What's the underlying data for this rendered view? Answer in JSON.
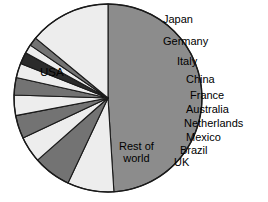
{
  "chart_data": {
    "type": "pie",
    "title": "",
    "subtitle": "",
    "xlabel": "",
    "ylabel": "",
    "legend_position": "callout-labels-right",
    "grid": false,
    "center": {
      "x": 108,
      "y": 98
    },
    "radius": 94,
    "start_angle_deg": 270,
    "direction": "clockwise",
    "categories": [
      "USA",
      "Japan",
      "Germany",
      "Italy",
      "China",
      "France",
      "Australia",
      "Netherlands",
      "Mexico",
      "Brazil",
      "UK",
      "Rest of world"
    ],
    "values": [
      49.0,
      8.0,
      6.5,
      4.5,
      4.0,
      3.5,
      3.0,
      2.5,
      2.0,
      1.5,
      1.5,
      14.0
    ],
    "slices": [
      {
        "label": "USA",
        "value": 49.0,
        "start_deg": 270.0,
        "end_deg": 86.4,
        "fill": "#8c8c8c",
        "label_placement": "inside",
        "label_x": 40,
        "label_y": 66
      },
      {
        "label": "Japan",
        "value": 8.0,
        "start_deg": 86.4,
        "end_deg": 115.2,
        "fill": "#ededed",
        "label_placement": "callout",
        "label_x": 163,
        "label_y": 14
      },
      {
        "label": "Germany",
        "value": 6.5,
        "start_deg": 115.2,
        "end_deg": 138.6,
        "fill": "#737373",
        "label_placement": "callout",
        "label_x": 163,
        "label_y": 36
      },
      {
        "label": "Italy",
        "value": 4.5,
        "start_deg": 138.6,
        "end_deg": 154.8,
        "fill": "#ededed",
        "label_placement": "callout",
        "label_x": 177,
        "label_y": 56
      },
      {
        "label": "China",
        "value": 4.0,
        "start_deg": 154.8,
        "end_deg": 169.2,
        "fill": "#737373",
        "label_placement": "callout",
        "label_x": 186,
        "label_y": 74
      },
      {
        "label": "France",
        "value": 3.5,
        "start_deg": 169.2,
        "end_deg": 181.8,
        "fill": "#ededed",
        "label_placement": "callout",
        "label_x": 190,
        "label_y": 90
      },
      {
        "label": "Australia",
        "value": 3.0,
        "start_deg": 181.8,
        "end_deg": 192.6,
        "fill": "#737373",
        "label_placement": "callout",
        "label_x": 186,
        "label_y": 104
      },
      {
        "label": "Netherlands",
        "value": 2.5,
        "start_deg": 192.6,
        "end_deg": 201.6,
        "fill": "#ededed",
        "label_placement": "callout",
        "label_x": 184,
        "label_y": 118
      },
      {
        "label": "Mexico",
        "value": 2.0,
        "start_deg": 201.6,
        "end_deg": 208.8,
        "fill": "#2b2b2b",
        "label_placement": "callout",
        "label_x": 186,
        "label_y": 132
      },
      {
        "label": "Brazil",
        "value": 1.5,
        "start_deg": 208.8,
        "end_deg": 214.2,
        "fill": "#ededed",
        "label_placement": "callout",
        "label_x": 180,
        "label_y": 145
      },
      {
        "label": "UK",
        "value": 1.5,
        "start_deg": 214.2,
        "end_deg": 219.6,
        "fill": "#737373",
        "label_placement": "callout",
        "label_x": 174,
        "label_y": 157
      },
      {
        "label": "Rest of world",
        "value": 14.0,
        "start_deg": 219.6,
        "end_deg": 270.0,
        "fill": "#ededed",
        "label_placement": "inside",
        "label_x": 119,
        "label_y": 141
      }
    ],
    "colors": {
      "usa_slice": "#8c8c8c",
      "light_slice": "#ededed",
      "dark_slice": "#737373",
      "darkest_slice": "#2b2b2b",
      "outline": "#1a1a1a",
      "background": "#ffffff",
      "text": "#000000"
    }
  },
  "labels": {
    "usa": "USA",
    "rest_of_world_line1": "Rest of",
    "rest_of_world_line2": "world",
    "japan": "Japan",
    "germany": "Germany",
    "italy": "Italy",
    "china": "China",
    "france": "France",
    "australia": "Australia",
    "netherlands": "Netherlands",
    "mexico": "Mexico",
    "brazil": "Brazil",
    "uk": "UK"
  }
}
